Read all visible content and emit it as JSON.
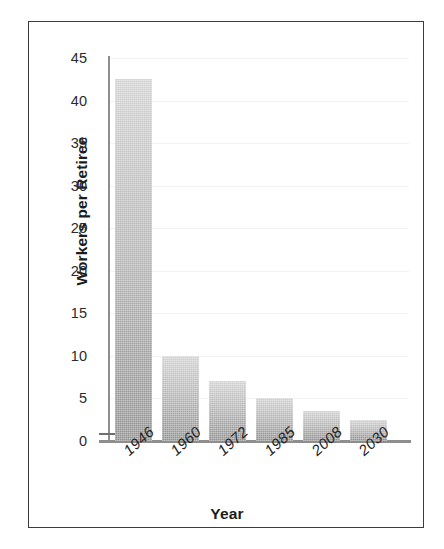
{
  "scan_artifact_text": "",
  "chart_data": {
    "type": "bar",
    "title": "",
    "xlabel": "Year",
    "ylabel": "Workers per Retiree",
    "categories": [
      "1946",
      "1960",
      "1972",
      "1985",
      "2008",
      "2030"
    ],
    "values": [
      42.5,
      10,
      7,
      5,
      3.5,
      2.5
    ],
    "yticks": [
      0,
      5,
      10,
      15,
      20,
      25,
      30,
      35,
      40,
      45
    ],
    "ytick_labels": [
      "0",
      "5",
      "10",
      "15",
      "20",
      "25",
      "30",
      "35",
      "40",
      "45"
    ],
    "ylim": [
      0,
      45
    ],
    "grid": true,
    "legend": false,
    "bar_color_top": "#d2d2d2",
    "bar_color_bottom": "#909090",
    "axis_color": "#8e8e8e",
    "frame_color": "#3b3b3b",
    "text_color": "#1c1c1c"
  }
}
